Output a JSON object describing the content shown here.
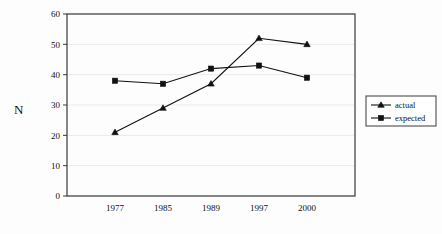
{
  "chart_data": {
    "type": "line",
    "title": "",
    "xlabel": "",
    "ylabel": "N",
    "categories": [
      "1977",
      "1985",
      "1989",
      "1997",
      "2000"
    ],
    "series": [
      {
        "name": "actual",
        "marker": "triangle",
        "color": "#111111",
        "values": [
          21,
          29,
          37,
          52,
          50
        ]
      },
      {
        "name": "expected",
        "marker": "square",
        "color": "#111111",
        "values": [
          38,
          37,
          42,
          43,
          39
        ]
      }
    ],
    "ylim": [
      0,
      60
    ],
    "yticks": [
      0,
      10,
      20,
      30,
      40,
      50,
      60
    ],
    "ytick_labels": [
      "0",
      "10",
      "20",
      "30",
      "40",
      "50",
      "60"
    ],
    "grid": "horizontal",
    "legend_position": "right-middle",
    "legend_entries": [
      "actual",
      "expected"
    ]
  },
  "figure": {
    "background_color": "#fdfdfd",
    "frame_color": "#3a3a3a",
    "gridline_color": "#e2e2e2"
  }
}
